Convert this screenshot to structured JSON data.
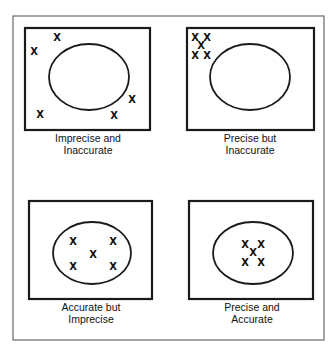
{
  "diagram": {
    "topic": "Precision vs. accuracy illustrated by marks relative to a target ellipse",
    "marker_glyph": "X",
    "panels": [
      {
        "id": "imprecise-inaccurate",
        "label_line1": "Imprecise and",
        "label_line2": "Inaccurate",
        "box": {
          "x": 25,
          "y": 28,
          "w": 125,
          "h": 102
        },
        "target": {
          "cx": 89,
          "cy": 77,
          "rx": 40,
          "ry": 33
        },
        "label_x": 88,
        "label_y1": 142,
        "label_y2": 154,
        "marks": [
          {
            "x": 57,
            "y": 37
          },
          {
            "x": 34,
            "y": 51
          },
          {
            "x": 132,
            "y": 99
          },
          {
            "x": 40,
            "y": 114
          },
          {
            "x": 114,
            "y": 115
          }
        ]
      },
      {
        "id": "precise-inaccurate",
        "label_line1": "Precise but",
        "label_line2": "Inaccurate",
        "box": {
          "x": 187,
          "y": 28,
          "w": 127,
          "h": 102
        },
        "target": {
          "cx": 250,
          "cy": 77,
          "rx": 40,
          "ry": 33
        },
        "label_x": 250,
        "label_y1": 142,
        "label_y2": 154,
        "marks": [
          {
            "x": 195,
            "y": 37
          },
          {
            "x": 207,
            "y": 37
          },
          {
            "x": 201,
            "y": 45
          },
          {
            "x": 195,
            "y": 55
          },
          {
            "x": 207,
            "y": 55
          }
        ]
      },
      {
        "id": "accurate-imprecise",
        "label_line1": "Accurate but",
        "label_line2": "Imprecise",
        "box": {
          "x": 29,
          "y": 201,
          "w": 123,
          "h": 98
        },
        "target": {
          "cx": 92,
          "cy": 253,
          "rx": 39,
          "ry": 31
        },
        "label_x": 91,
        "label_y1": 311,
        "label_y2": 323,
        "marks": [
          {
            "x": 73,
            "y": 241
          },
          {
            "x": 113,
            "y": 241
          },
          {
            "x": 93,
            "y": 254
          },
          {
            "x": 73,
            "y": 266
          },
          {
            "x": 113,
            "y": 266
          }
        ]
      },
      {
        "id": "precise-accurate",
        "label_line1": "Precise and",
        "label_line2": "Accurate",
        "box": {
          "x": 189,
          "y": 201,
          "w": 124,
          "h": 98
        },
        "target": {
          "cx": 253,
          "cy": 253,
          "rx": 40,
          "ry": 31
        },
        "label_x": 252,
        "label_y1": 311,
        "label_y2": 323,
        "marks": [
          {
            "x": 245,
            "y": 244
          },
          {
            "x": 261,
            "y": 244
          },
          {
            "x": 253,
            "y": 252
          },
          {
            "x": 245,
            "y": 262
          },
          {
            "x": 261,
            "y": 262
          }
        ]
      }
    ],
    "outer_frame": {
      "x": 13,
      "y": 16,
      "w": 311,
      "h": 324
    }
  },
  "colors": {
    "ink": "#111111",
    "frame": "#6a6a6a",
    "background": "#ffffff"
  }
}
